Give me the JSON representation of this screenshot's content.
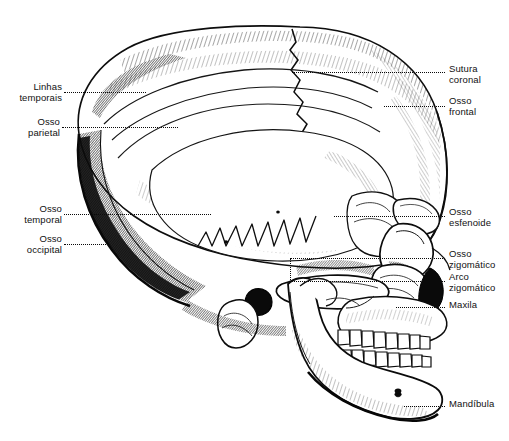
{
  "figure": {
    "language": "pt-BR",
    "background_color": "#ffffff",
    "ink_color": "#111111",
    "leader_color": "#0a0a0a"
  },
  "labels_left": [
    {
      "id": "linhas-temporais",
      "text": "Linhas\ntemporais"
    },
    {
      "id": "osso-parietal",
      "text": "Osso\nparietal"
    },
    {
      "id": "osso-temporal",
      "text": "Osso\ntemporal"
    },
    {
      "id": "osso-occipital",
      "text": "Osso\noccipital"
    }
  ],
  "labels_right": [
    {
      "id": "sutura-coronal",
      "text": "Sutura\ncoronal"
    },
    {
      "id": "osso-frontal",
      "text": "Osso\nfrontal"
    },
    {
      "id": "osso-esfenoide",
      "text": "Osso\nesfenoide"
    },
    {
      "id": "osso-zigomatico",
      "text": "Osso\nzigomático"
    },
    {
      "id": "arco-zigomatico",
      "text": "Arco\nzigomático"
    },
    {
      "id": "maxila",
      "text": "Maxila"
    },
    {
      "id": "mandibula",
      "text": "Mandíbula"
    }
  ]
}
